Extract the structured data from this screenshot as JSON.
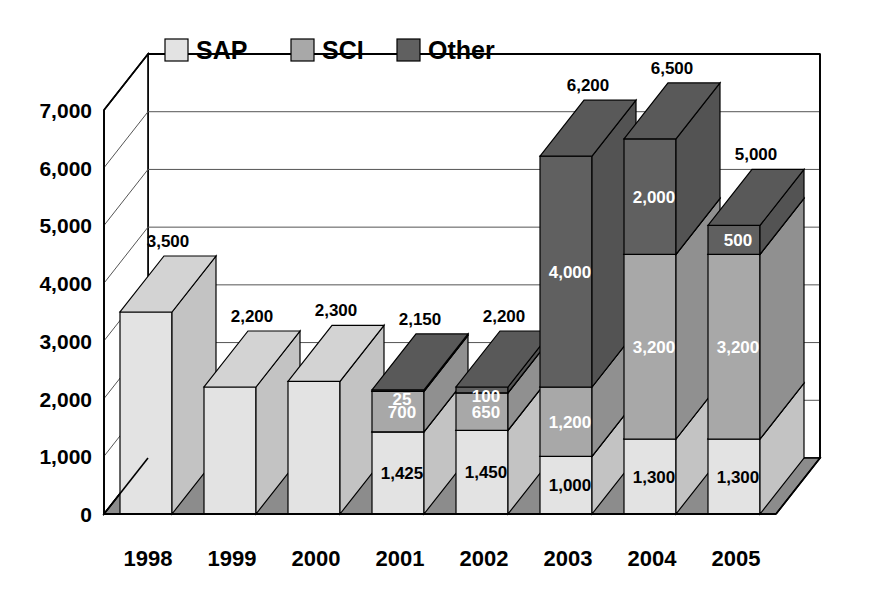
{
  "chart_data": {
    "type": "bar",
    "subtype": "stacked-column-3d",
    "title": "",
    "xlabel": "",
    "ylabel": "",
    "ylim": [
      0,
      7000
    ],
    "ytick_values": [
      0,
      1000,
      2000,
      3000,
      4000,
      5000,
      6000,
      7000
    ],
    "ytick_labels": [
      "0",
      "1,000",
      "2,000",
      "3,000",
      "4,000",
      "5,000",
      "6,000",
      "7,000"
    ],
    "grid": true,
    "legend_position": "top-inside",
    "stacked": true,
    "categories": [
      "1998",
      "1999",
      "2000",
      "2001",
      "2002",
      "2003",
      "2004",
      "2005"
    ],
    "series": [
      {
        "name": "SAP",
        "color": "#e3e3e3",
        "values": [
          3500,
          2200,
          2300,
          1425,
          1450,
          1000,
          1300,
          1300
        ],
        "labels": [
          "3,500",
          "2,200",
          "2,300",
          "1,425",
          "1,450",
          "1,000",
          "1,300",
          "1,300"
        ]
      },
      {
        "name": "SCI",
        "color": "#a8a8a8",
        "values": [
          0,
          0,
          0,
          700,
          650,
          1200,
          3200,
          3200
        ],
        "labels": [
          "",
          "",
          "",
          "700",
          "650",
          "1,200",
          "3,200",
          "3,200"
        ]
      },
      {
        "name": "Other",
        "color": "#606060",
        "values": [
          0,
          0,
          0,
          25,
          100,
          4000,
          2000,
          500
        ],
        "labels": [
          "",
          "",
          "",
          "25",
          "100",
          "4,000",
          "2,000",
          "500"
        ]
      }
    ],
    "totals": [
      3500,
      2200,
      2300,
      2150,
      2200,
      6200,
      6500,
      5000
    ],
    "total_labels": [
      "3,500",
      "2,200",
      "2,300",
      "2,150",
      "2,200",
      "6,200",
      "6,500",
      "5,000"
    ]
  },
  "legend": {
    "items": [
      {
        "label": "SAP",
        "swatch_color": "#e3e3e3"
      },
      {
        "label": "SCI",
        "swatch_color": "#a8a8a8"
      },
      {
        "label": "Other",
        "swatch_color": "#606060"
      }
    ]
  },
  "axes": {
    "y_ticks": [
      "7,000",
      "6,000",
      "5,000",
      "4,000",
      "3,000",
      "2,000",
      "1,000",
      "0"
    ],
    "x_ticks": [
      "1998",
      "1999",
      "2000",
      "2001",
      "2002",
      "2003",
      "2004",
      "2005"
    ]
  },
  "colors": {
    "sap": "#e3e3e3",
    "sci": "#a8a8a8",
    "other": "#606060",
    "floor": "#8c8c8c",
    "frame": "#000000",
    "background": "#ffffff"
  }
}
